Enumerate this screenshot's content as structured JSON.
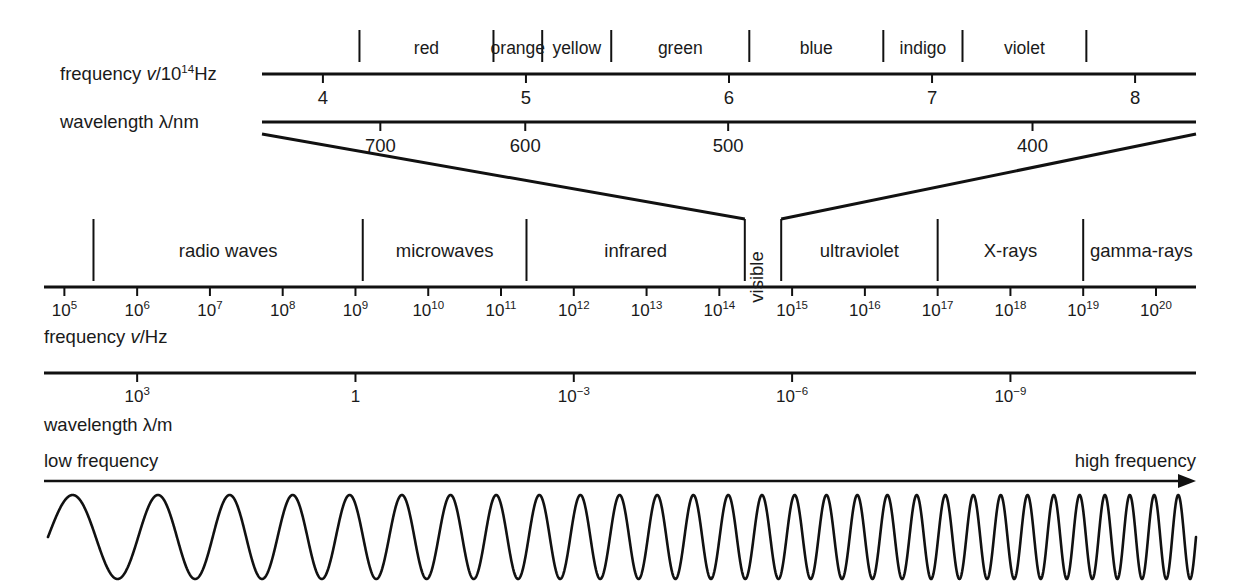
{
  "figure": {
    "background_color": "#ffffff",
    "ink_color": "#111111"
  },
  "visible_axis": {
    "frequency_row_label_pre": "frequency ",
    "frequency_row_label_italic": "v",
    "frequency_row_label_post": "/10",
    "frequency_row_label_exp": "14",
    "frequency_row_label_unit": "Hz",
    "wavelength_row_label_pre": "wavelength ",
    "wavelength_row_label_post": "λ/nm",
    "frequency_ticks": [
      "4",
      "5",
      "6",
      "7",
      "8"
    ],
    "frequency_tick_values": [
      4,
      5,
      6,
      7,
      8
    ],
    "wavelength_ticks": [
      "700",
      "600",
      "500",
      "400"
    ],
    "wavelength_tick_values": [
      700,
      600,
      500,
      400
    ],
    "colors": [
      {
        "name": "red",
        "start_freq": 4.18,
        "end_freq": 4.84
      },
      {
        "name": "orange",
        "start_freq": 4.84,
        "end_freq": 5.08
      },
      {
        "name": "yellow",
        "start_freq": 5.08,
        "end_freq": 5.42
      },
      {
        "name": "green",
        "start_freq": 5.42,
        "end_freq": 6.1
      },
      {
        "name": "blue",
        "start_freq": 6.1,
        "end_freq": 6.76
      },
      {
        "name": "indigo",
        "start_freq": 6.76,
        "end_freq": 7.15
      },
      {
        "name": "violet",
        "start_freq": 7.15,
        "end_freq": 7.76
      }
    ],
    "separator_freqs": [
      4.18,
      4.84,
      5.08,
      5.42,
      6.1,
      6.76,
      7.15,
      7.76
    ]
  },
  "em_axis": {
    "frequency_row_label_pre": "frequency ",
    "frequency_row_label_italic": "v",
    "frequency_row_label_post": "/Hz",
    "wavelength_row_label": "wavelength λ/m",
    "frequency_exponents": [
      5,
      6,
      7,
      8,
      9,
      10,
      11,
      12,
      13,
      14,
      15,
      16,
      17,
      18,
      19,
      20
    ],
    "frequency_tick_labels": [
      "10⁵",
      "10⁶",
      "10⁷",
      "10⁸",
      "10⁹",
      "10¹⁰",
      "10¹¹",
      "10¹²",
      "10¹³",
      "10¹⁴",
      "10¹⁵",
      "10¹⁶",
      "10¹⁷",
      "10¹⁸",
      "10¹⁹",
      "10²⁰"
    ],
    "wavelength_ticks": [
      {
        "label_base": "10",
        "label_exp": "3",
        "at_exponent": 6
      },
      {
        "label_base": "1",
        "label_exp": "",
        "at_exponent": 9
      },
      {
        "label_base": "10",
        "label_exp": "−3",
        "at_exponent": 12
      },
      {
        "label_base": "10",
        "label_exp": "−6",
        "at_exponent": 15
      },
      {
        "label_base": "10",
        "label_exp": "−9",
        "at_exponent": 18
      }
    ],
    "bands": [
      {
        "name": "radio waves",
        "start_exponent": 5.4,
        "end_exponent": 9.1
      },
      {
        "name": "microwaves",
        "start_exponent": 9.1,
        "end_exponent": 11.35
      },
      {
        "name": "infrared",
        "start_exponent": 11.35,
        "end_exponent": 14.35
      },
      {
        "name": "visible",
        "start_exponent": 14.35,
        "end_exponent": 14.85,
        "orientation": "vertical"
      },
      {
        "name": "ultraviolet",
        "start_exponent": 14.85,
        "end_exponent": 17.0
      },
      {
        "name": "X-rays",
        "start_exponent": 17.0,
        "end_exponent": 19.0
      },
      {
        "name": "gamma-rays",
        "start_exponent": 19.0,
        "end_exponent": 20.6
      }
    ],
    "band_separator_exponents": [
      5.4,
      9.1,
      11.35,
      14.35,
      14.85,
      17.0,
      19.0
    ]
  },
  "direction": {
    "left_label": "low frequency",
    "right_label": "high frequency",
    "arrow": "right-arrow-icon"
  },
  "wave": {
    "description": "sine wave with frequency increasing left to right",
    "cycles": 30,
    "amplitude": 42
  }
}
